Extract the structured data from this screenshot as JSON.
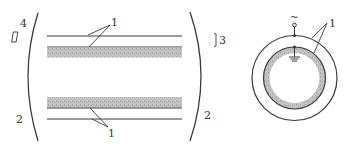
{
  "diagram": {
    "type": "cross-section schematic of a coaxial electrode tube",
    "longitudinal_view": {
      "labels": {
        "top_left": "4",
        "bottom_left": "2",
        "bottom_right": "2",
        "top_right": "3",
        "top_leader": "1",
        "bottom_leader": "1"
      }
    },
    "transverse_view": {
      "labels": {
        "ac_source": "~",
        "electrode_leader": "1"
      }
    },
    "colors": {
      "line": "#3a3a3a",
      "dielectric_fill": "#bdbdbd",
      "background": "#ffffff"
    }
  }
}
